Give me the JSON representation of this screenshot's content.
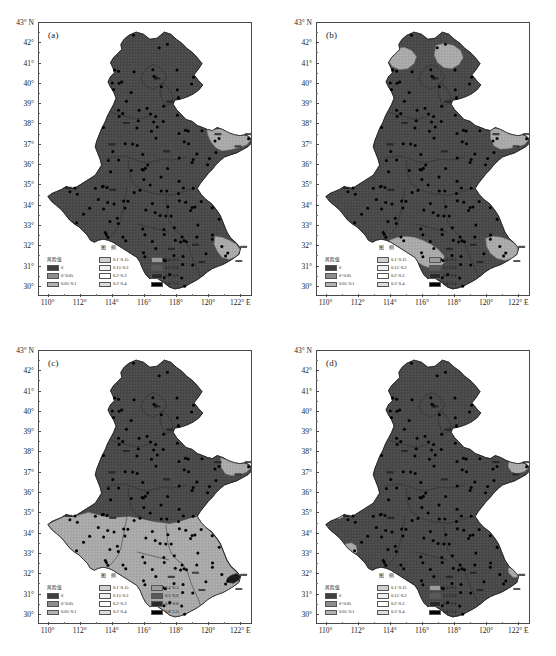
{
  "figure": {
    "type": "four-panel-choropleth-risk-map",
    "region": "North China Plain (Beijing, Tianjin, Hebei, Shandong, Henan, Anhui, Jiangsu)"
  },
  "axes": {
    "y_unit_label": "43° N",
    "y_ticks": [
      "43° N",
      "42°",
      "41°",
      "40°",
      "39°",
      "38°",
      "37°",
      "36°",
      "35°",
      "34°",
      "33°",
      "32°",
      "31°",
      "30°"
    ],
    "y_values": [
      43,
      42,
      41,
      40,
      39,
      38,
      37,
      36,
      35,
      34,
      33,
      32,
      31,
      30
    ],
    "x_ticks": [
      "110°",
      "112°",
      "114°",
      "116°",
      "118°",
      "120°",
      "122° E"
    ],
    "x_values": [
      110,
      112,
      114,
      116,
      118,
      120,
      122
    ],
    "xlim": [
      109.4,
      122.6
    ],
    "ylim": [
      29.6,
      43.0
    ]
  },
  "panels": [
    {
      "id": "a",
      "label": "(a)"
    },
    {
      "id": "b",
      "label": "(b)"
    },
    {
      "id": "c",
      "label": "(c)"
    },
    {
      "id": "d",
      "label": "(d)"
    }
  ],
  "legend": {
    "header": "图 例",
    "value_label": "风险值",
    "column1": [
      {
        "range": "0",
        "color": "#3f3f3f"
      },
      {
        "range": "0~0.05",
        "color": "#8c8c8c"
      },
      {
        "range": "0.05~0.1",
        "color": "#b3b3b3"
      }
    ],
    "column2": [
      {
        "range": "0.1~0.15",
        "color": "#cfcfcf"
      },
      {
        "range": "0.15~0.2",
        "color": "#efefef"
      },
      {
        "range": "0.2~0.3",
        "color": "#ffffff"
      },
      {
        "range": "0.3~0.4",
        "color": "#dcdcdc"
      }
    ],
    "column3": [
      {
        "range": "0.4~0.5",
        "color": "#9a9a9a"
      },
      {
        "range": "0.5~0.6",
        "color": "#5a5a5a"
      },
      {
        "range": "0.6~0.8",
        "color": "#2a2a2a"
      },
      {
        "range": "0.8~1.0",
        "color": "#000000"
      }
    ]
  },
  "chart_data": {
    "type": "heatmap",
    "title": "",
    "xlabel": "Longitude (° E)",
    "ylabel": "Latitude (° N)",
    "xlim": [
      109.4,
      122.6
    ],
    "ylim": [
      29.6,
      43.0
    ],
    "grid": false,
    "legend_position": "inside-bottom-left",
    "colorbar_label": "风险值",
    "class_breaks": [
      0,
      0.05,
      0.1,
      0.15,
      0.2,
      0.3,
      0.4,
      0.5,
      0.6,
      0.8,
      1.0
    ],
    "class_labels": [
      "0",
      "0~0.05",
      "0.05~0.1",
      "0.1~0.15",
      "0.15~0.2",
      "0.2~0.3",
      "0.3~0.4",
      "0.4~0.5",
      "0.5~0.6",
      "0.6~0.8",
      "0.8~1.0"
    ],
    "class_colors": [
      "#3f3f3f",
      "#8c8c8c",
      "#b3b3b3",
      "#cfcfcf",
      "#efefef",
      "#ffffff",
      "#dcdcdc",
      "#9a9a9a",
      "#5a5a5a",
      "#2a2a2a",
      "#000000"
    ],
    "panels": [
      {
        "name": "(a)",
        "dominant_class": "0",
        "regions": [
          {
            "area": "main landmass (Hebei, Beijing, Tianjin, Shandong, Henan, N. Anhui, N. Jiangsu)",
            "class": "0",
            "value": 0.0
          },
          {
            "area": "eastern Shandong peninsula (Yantai-Weihai-Qingdao coast)",
            "class": "0.05~0.1",
            "value": 0.075
          },
          {
            "area": "southeast Jiangsu (Shanghai-Suzhou corner)",
            "class": "0.05~0.1",
            "value": 0.075
          }
        ]
      },
      {
        "name": "(b)",
        "dominant_class": "0",
        "regions": [
          {
            "area": "main landmass",
            "class": "0",
            "value": 0.0
          },
          {
            "area": "north Hebei (Zhangjiakou)",
            "class": "0.05~0.1",
            "value": 0.075
          },
          {
            "area": "northeast Hebei (Chengde)",
            "class": "0.05~0.1",
            "value": 0.075
          },
          {
            "area": "Shandong peninsula east coast",
            "class": "0.05~0.1",
            "value": 0.075
          },
          {
            "area": "south Henan / north Anhui (Fuyang-Bengbu)",
            "class": "0.05~0.1",
            "value": 0.075
          },
          {
            "area": "southeast Jiangsu (Suzhou-Shanghai)",
            "class": "0.05~0.1",
            "value": 0.075
          }
        ]
      },
      {
        "name": "(c)",
        "dominant_class": "0",
        "regions": [
          {
            "area": "northern landmass above ~34.5°N (Hebei, Beijing, Tianjin, Shandong, N. Henan)",
            "class": "0",
            "value": 0.0
          },
          {
            "area": "southern belt below ~34.5°N (S. Henan, Anhui, Jiangsu)",
            "class": "0.05~0.1",
            "value": 0.075
          },
          {
            "area": "Shandong peninsula east tip",
            "class": "0.05~0.1",
            "value": 0.075
          },
          {
            "area": "southeast Jiangsu corner (Shanghai)",
            "class": "0.5~0.6",
            "value": 0.55
          }
        ]
      },
      {
        "name": "(d)",
        "dominant_class": "0",
        "regions": [
          {
            "area": "main landmass",
            "class": "0",
            "value": 0.0
          },
          {
            "area": "west Henan patch (~111.5°E, 33.2°N)",
            "class": "0.05~0.1",
            "value": 0.075
          },
          {
            "area": "Shandong peninsula east tip",
            "class": "0.05~0.1",
            "value": 0.075
          },
          {
            "area": "southeast Jiangsu corner",
            "class": "0.05~0.1",
            "value": 0.075
          },
          {
            "area": "northwest Henan sliver (~110.8°E, 34.9°N)",
            "class": "0.05~0.1",
            "value": 0.075
          }
        ]
      }
    ]
  },
  "colors": {
    "base_fill": "#4a4a4a",
    "light_region": "#a9a9a9",
    "very_light_region": "#c8c8c8",
    "dark_patch": "#1b1b1b",
    "province_border": "#2b2b2b",
    "outline": "#202020",
    "station_point": "#000000",
    "frame": "#4a4a4a",
    "background": "#ffffff"
  },
  "stations": {
    "marker": "filled-circle",
    "count_per_panel": 152
  }
}
